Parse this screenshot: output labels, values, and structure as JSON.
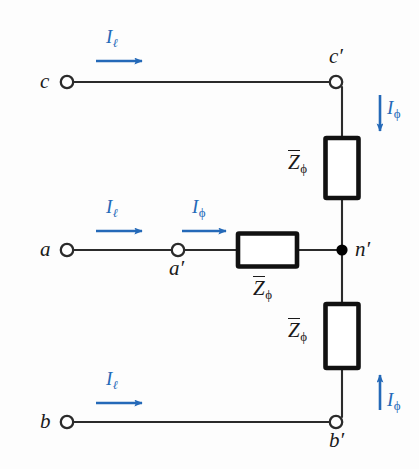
{
  "figure": {
    "colors": {
      "wire": "#2b2b2b",
      "impedance_outline": "#111111",
      "current_arrow": "#2469b8",
      "background": "#fdfdfd",
      "node_fill": "#000000",
      "terminal_fill": "#ffffff"
    }
  },
  "terminals": [
    {
      "id": "c",
      "label": "c",
      "prime": "",
      "type": "open-circle"
    },
    {
      "id": "a",
      "label": "a",
      "prime": "",
      "type": "open-circle"
    },
    {
      "id": "b",
      "label": "b",
      "prime": "",
      "type": "open-circle"
    },
    {
      "id": "cp",
      "label": "c",
      "prime": "′",
      "type": "open-circle"
    },
    {
      "id": "ap",
      "label": "a",
      "prime": "′",
      "type": "open-circle"
    },
    {
      "id": "bp",
      "label": "b",
      "prime": "′",
      "type": "open-circle"
    },
    {
      "id": "np",
      "label": "n",
      "prime": "′",
      "type": "filled-dot"
    }
  ],
  "labels": {
    "c": "c",
    "a": "a",
    "b": "b",
    "c_prime_base": "c",
    "a_prime_base": "a",
    "b_prime_base": "b",
    "n_prime_base": "n",
    "prime_mark": "′"
  },
  "currents": {
    "line": {
      "symbol": "I",
      "subscript": "ℓ",
      "name": "line-current"
    },
    "phase": {
      "symbol": "I",
      "subscript": "ϕ",
      "name": "phase-current"
    },
    "arrows": [
      {
        "id": "Il-c",
        "phase": "c",
        "kind": "line",
        "direction": "right"
      },
      {
        "id": "Il-a",
        "phase": "a",
        "kind": "line",
        "direction": "right"
      },
      {
        "id": "Il-b",
        "phase": "b",
        "kind": "line",
        "direction": "right"
      },
      {
        "id": "Iphi-c",
        "phase": "c",
        "kind": "phase",
        "direction": "down"
      },
      {
        "id": "Iphi-a",
        "phase": "a",
        "kind": "phase",
        "direction": "right"
      },
      {
        "id": "Iphi-b",
        "phase": "b",
        "kind": "phase",
        "direction": "up"
      }
    ]
  },
  "impedances": [
    {
      "id": "z-c",
      "symbol": "Z",
      "subscript": "ϕ",
      "overbar": true,
      "orientation": "vertical",
      "branch": "c′ to n′"
    },
    {
      "id": "z-a",
      "symbol": "Z",
      "subscript": "ϕ",
      "overbar": true,
      "orientation": "horizontal",
      "branch": "a′ to n′"
    },
    {
      "id": "z-b",
      "symbol": "Z",
      "subscript": "ϕ",
      "overbar": true,
      "orientation": "vertical",
      "branch": "n′ to b′"
    }
  ]
}
